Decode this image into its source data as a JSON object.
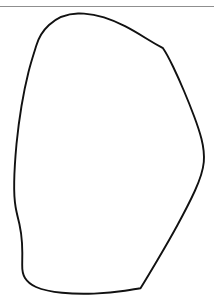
{
  "figure": {
    "canvas": {
      "width": 214,
      "height": 308,
      "background_color": "#ffffff"
    },
    "top_rule": {
      "name": "horizontal-rule",
      "color": "#8f8f8f",
      "y": 6.5,
      "x_start": 0,
      "x_end": 214,
      "thickness": 1.2
    },
    "contour": {
      "name": "blob-outline",
      "stroke_color": "#111111",
      "stroke_width": 1.9,
      "fill": "none",
      "closed": true,
      "bounds": {
        "left": 14,
        "top": 13,
        "right": 204,
        "bottom": 294
      },
      "path": "M 78 13.5 C 66 13.8 56 18.5 49 25 C 42 31.5 38.5 38.5 36.5 45 C 34 53 31 62 28.5 72 C 26 82 23.5 94 21.5 106 C 19.5 118 17.8 131 16.5 144 C 15.3 157 14.4 170 14.2 182 C 14.0 192 14.4 200 15.6 207 C 16.6 213 18 218 19.4 224 C 20.7 230 21.6 236 22 243 C 22.4 250 22.4 258 22.2 265 C 22.1 270 22.8 274.5 25 278 C 27.5 282 31.5 285 36 287 C 43 290 52 291.8 62 292.8 C 72 293.8 83 294 94 293.6 C 105 293.2 116 292.2 125 290.8 C 131.5 289.8 136.5 289 140.5 288.3 C 145 281 151 271 157.5 260 C 164 249 171 237 177.5 225 C 184 213 190 201.5 194.8 191 C 199.6 180.5 203 171 203.8 162 C 204.4 154 203.4 146.5 201.5 139 C 199.6 131.5 197 124 194 116 C 191 108 187.6 99.5 184 91 C 180.4 82.5 176.6 74 173 66.5 C 169.4 59 166 52.5 163 48.2 C 158 45.5 152 42 145.5 38 C 139 34 132 29.8 125 26.2 C 118 22.6 111 19.6 104 17.4 C 97 15.2 90 13.9 84 13.6 C 82 13.5 80 13.45 78 13.5 Z"
    }
  }
}
